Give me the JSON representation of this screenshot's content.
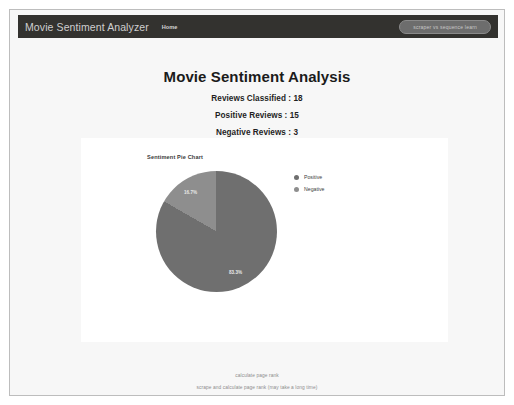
{
  "navbar": {
    "brand": "Movie Sentiment Analyzer",
    "home_link": "Home",
    "action_button": "scraper vs sequence learn"
  },
  "headings": {
    "title": "Movie Sentiment Analysis",
    "reviews_classified": "Reviews Classified : 18",
    "positive_reviews": "Positive Reviews : 15",
    "negative_reviews": "Negative Reviews : 3"
  },
  "chart_card": {
    "title": "Sentiment Pie Chart",
    "legend": [
      {
        "label": "Positive",
        "color": "#6f6f6f"
      },
      {
        "label": "Negative",
        "color": "#8e8e8e"
      }
    ]
  },
  "chart_data": {
    "type": "pie",
    "title": "Sentiment Pie Chart",
    "categories": [
      "Positive",
      "Negative"
    ],
    "values": [
      15,
      3
    ],
    "percentages": [
      83.3,
      16.7
    ],
    "labels": [
      "83.3%",
      "16.7%"
    ],
    "colors": [
      "#6f6f6f",
      "#8e8e8e"
    ],
    "legend_position": "right",
    "start_angle_deg": 0,
    "total": 18
  },
  "footer": {
    "line1": "calculate page rank",
    "line2": "scrape and calculate page rank (may take a long time)"
  },
  "colors": {
    "navbar_bg": "#33322f",
    "page_bg": "#f7f7f7",
    "card_bg": "#ffffff",
    "positive": "#6f6f6f",
    "negative": "#8e8e8e"
  }
}
